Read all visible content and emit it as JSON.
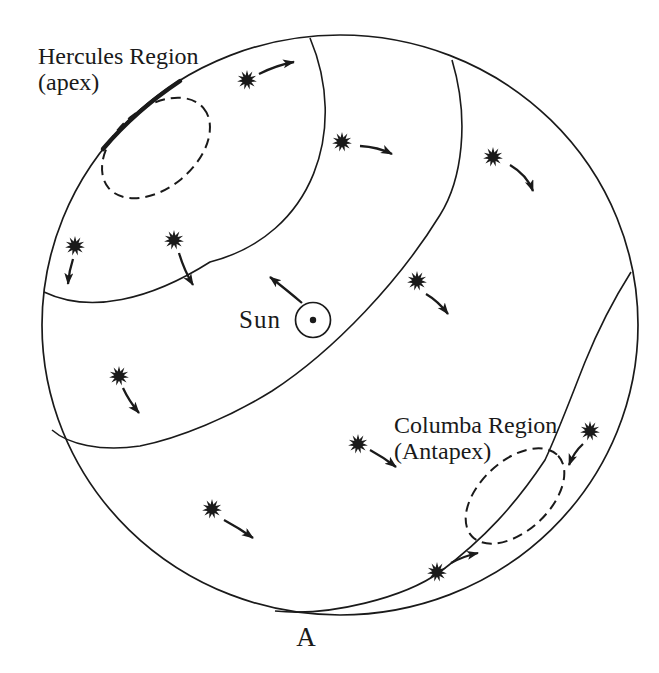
{
  "labels": {
    "hercules_line1": "Hercules Region",
    "hercules_line2": "(apex)",
    "sun": "Sun",
    "columba_line1": "Columba Region",
    "columba_line2": "(Antapex)",
    "panel": "A"
  },
  "colors": {
    "ink": "#1a1a1a",
    "background": "#ffffff"
  },
  "figure": {
    "width": 659,
    "height": 673,
    "sphere": {
      "cx": 340,
      "cy": 325,
      "rx": 298,
      "ry": 290
    },
    "arcs": {
      "apex_cap": "M 44 292 C 90 314 150 300 210 262 C 315 235 348 128 310 38",
      "mid_great_circle": "M 452 60 C 470 120 462 180 440 215 C 400 280 335 350 272 391 C 230 417 180 438 140 446 C 100 452 68 444 52 430",
      "antapex_great_circle": "M 631 272 C 612 302 598 330 585 362 C 568 405 558 432 545 460 C 515 505 485 538 440 572 C 405 597 330 617 275 611",
      "apex_limb_overlap": "M 103 149 C 125 123 150 101 180 81"
    },
    "apex_ellipse": {
      "cx": 156,
      "cy": 148,
      "rx": 62,
      "ry": 40,
      "rotate": -40
    },
    "antapex_ellipse": {
      "cx": 515,
      "cy": 496,
      "rx": 59,
      "ry": 35,
      "rotate": -43
    },
    "star_style": {
      "outer_r": 10,
      "inner_r": 4.8,
      "spikes": 11
    },
    "stars": [
      {
        "x": 247,
        "y": 80,
        "arrow": [
          259,
          74,
          277,
          65,
          294,
          62
        ]
      },
      {
        "x": 342,
        "y": 142,
        "arrow": [
          360,
          146,
          378,
          147,
          392,
          154
        ]
      },
      {
        "x": 493,
        "y": 157,
        "arrow": [
          510,
          165,
          527,
          175,
          533,
          191
        ]
      },
      {
        "x": 75,
        "y": 246,
        "arrow": [
          73,
          259,
          69,
          271,
          68,
          284
        ]
      },
      {
        "x": 174,
        "y": 240,
        "arrow": [
          179,
          253,
          184,
          270,
          193,
          285
        ]
      },
      {
        "x": 417,
        "y": 281,
        "arrow": [
          426,
          294,
          438,
          301,
          448,
          314
        ]
      },
      {
        "x": 119,
        "y": 376,
        "arrow": [
          123,
          388,
          129,
          401,
          139,
          413
        ]
      },
      {
        "x": 358,
        "y": 444,
        "arrow": [
          370,
          450,
          383,
          457,
          396,
          467
        ]
      },
      {
        "x": 590,
        "y": 431,
        "arrow": [
          583,
          444,
          574,
          452,
          569,
          465
        ]
      },
      {
        "x": 212,
        "y": 509,
        "arrow": [
          224,
          520,
          239,
          528,
          253,
          538
        ]
      },
      {
        "x": 437,
        "y": 572,
        "arrow": [
          451,
          563,
          464,
          556,
          478,
          553
        ]
      }
    ],
    "sun": {
      "cx": 313,
      "cy": 320,
      "r": 17.5,
      "dot_r": 3.2,
      "arrow": [
        302,
        303,
        288,
        291,
        270,
        277
      ]
    }
  }
}
